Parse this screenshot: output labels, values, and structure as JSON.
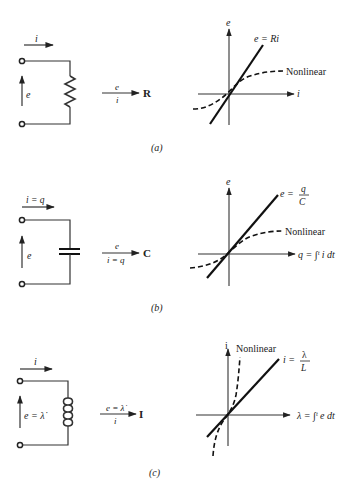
{
  "figure": {
    "panels": [
      {
        "id": "a",
        "caption": "(a)",
        "element": "resistor",
        "circuit": {
          "current_label": "i",
          "voltage_label": "e"
        },
        "mapping": {
          "numerator": "e",
          "denominator": "i",
          "result": "R"
        },
        "graph": {
          "y_axis_label": "e",
          "x_axis_label": "i",
          "linear_label": "e = Ri",
          "nonlinear_label": "Nonlinear"
        }
      },
      {
        "id": "b",
        "caption": "(b)",
        "element": "capacitor",
        "circuit": {
          "current_label": "i = q",
          "voltage_label": "e"
        },
        "mapping": {
          "numerator": "e",
          "denominator": "i = q",
          "result": "C"
        },
        "graph": {
          "y_axis_label": "e",
          "x_axis_label": "q = ∫ᵗ i dt",
          "linear_label_prefix": "e =",
          "linear_label_num": "q",
          "linear_label_den": "C",
          "nonlinear_label": "Nonlinear"
        }
      },
      {
        "id": "c",
        "caption": "(c)",
        "element": "inductor",
        "circuit": {
          "current_label": "i",
          "voltage_label": "e = λ̇"
        },
        "mapping": {
          "numerator": "e = λ̇",
          "denominator": "i",
          "result": "I"
        },
        "graph": {
          "y_axis_label": "i",
          "x_axis_label": "λ = ∫ᵗ e dt",
          "linear_label_prefix": "i =",
          "linear_label_num": "λ",
          "linear_label_den": "L",
          "nonlinear_label": "Nonlinear"
        }
      }
    ]
  }
}
